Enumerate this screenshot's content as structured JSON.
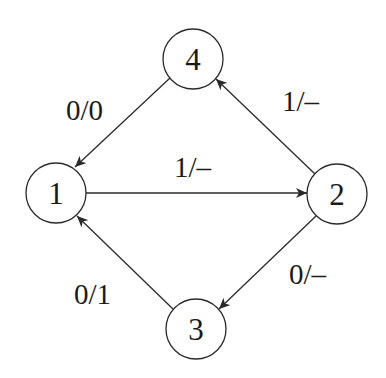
{
  "diagram": {
    "type": "state-transition-diagram",
    "colors": {
      "background": "#ffffff",
      "stroke": "#2a2a2a",
      "text": "#1a1a1a"
    },
    "nodes": [
      {
        "id": "1",
        "label": "1",
        "cx": 56,
        "cy": 193,
        "r": 30
      },
      {
        "id": "2",
        "label": "2",
        "cx": 337,
        "cy": 194,
        "r": 30
      },
      {
        "id": "3",
        "label": "3",
        "cx": 196,
        "cy": 329,
        "r": 30
      },
      {
        "id": "4",
        "label": "4",
        "cx": 193,
        "cy": 59,
        "r": 30
      }
    ],
    "edges": [
      {
        "from": "4",
        "to": "1",
        "label": "0/0",
        "label_x": 66,
        "label_y": 120
      },
      {
        "from": "2",
        "to": "4",
        "label": "1/–",
        "label_x": 282,
        "label_y": 111
      },
      {
        "from": "1",
        "to": "2",
        "label": "1/–",
        "label_x": 174,
        "label_y": 177
      },
      {
        "from": "2",
        "to": "3",
        "label": "0/–",
        "label_x": 289,
        "label_y": 284
      },
      {
        "from": "3",
        "to": "1",
        "label": "0/1",
        "label_x": 74,
        "label_y": 304
      }
    ]
  }
}
